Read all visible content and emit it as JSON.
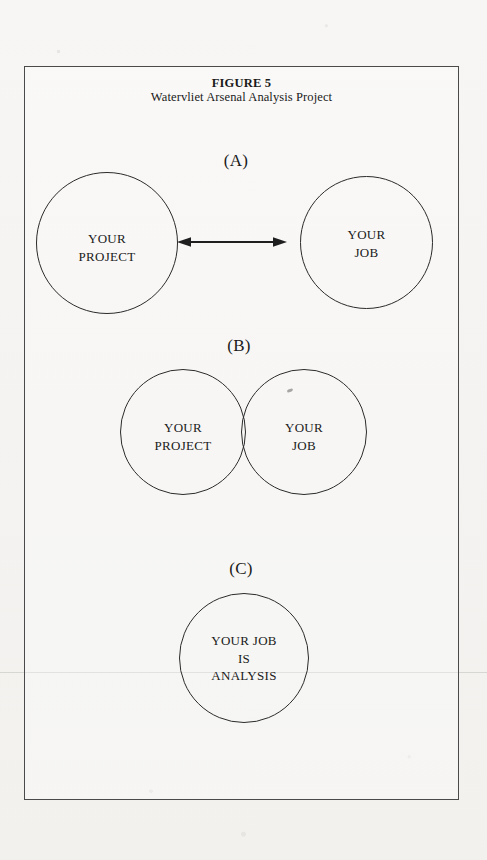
{
  "figure": {
    "title": "FIGURE 5",
    "subtitle": "Watervliet Arsenal Analysis Project"
  },
  "panels": [
    {
      "label": "(A)",
      "type": "two-separate-circles-with-double-arrow",
      "circles": [
        {
          "text": "YOUR\nPROJECT"
        },
        {
          "text": "YOUR\nJOB"
        }
      ],
      "connector": "double-headed-arrow"
    },
    {
      "label": "(B)",
      "type": "two-overlapping-circles-venn",
      "circles": [
        {
          "text": "YOUR\nPROJECT"
        },
        {
          "text": "YOUR\nJOB"
        }
      ]
    },
    {
      "label": "(C)",
      "type": "single-circle",
      "circles": [
        {
          "text": "YOUR JOB\nIS\nANALYSIS"
        }
      ]
    }
  ],
  "colors": {
    "paper": "#f6f5f3",
    "ink": "#1a1a1a",
    "stroke": "#2b2b2b",
    "frame": "#4a4a4a"
  }
}
